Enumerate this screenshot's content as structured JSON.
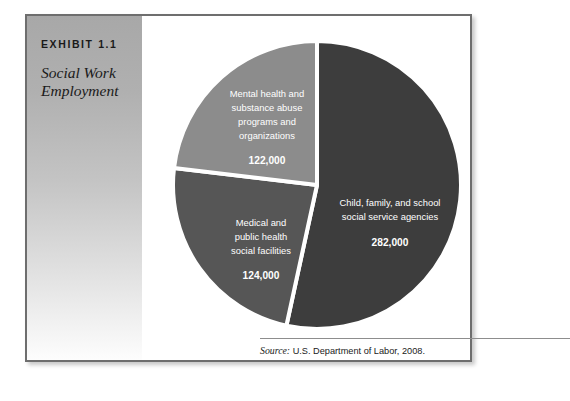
{
  "exhibit": {
    "number_label": "EXHIBIT 1.1",
    "title_line1": "Social Work",
    "title_line2": "Employment"
  },
  "source": {
    "label": "Source:",
    "text": "U.S. Department of Labor, 2008."
  },
  "colors": {
    "slice_dark": "#3d3d3d",
    "slice_medium": "#565656",
    "slice_light": "#8c8c8c",
    "separator": "#ffffff",
    "frame_border": "#6e6e6e",
    "panel_top": "#a8a8a8",
    "panel_bottom": "#fdfdfd"
  },
  "chart_data": {
    "type": "pie",
    "title": "Social Work Employment",
    "xlabel": "",
    "ylabel": "",
    "legend_position": "none",
    "grid": false,
    "total": 528000,
    "categories": [
      "Child, family, and school social service agencies",
      "Medical and public health social facilities",
      "Mental health and substance abuse programs and organizations"
    ],
    "values": [
      282000,
      124000,
      122000
    ],
    "value_labels": [
      "282,000",
      "124,000",
      "122,000"
    ],
    "slices": [
      {
        "name": "Child, family, and school social service agencies",
        "value": 282000,
        "value_label": "282,000",
        "percent": 53.4,
        "color": "#3d3d3d",
        "label_lines": [
          "Child, family, and school",
          "social service agencies"
        ]
      },
      {
        "name": "Medical and public health social facilities",
        "value": 124000,
        "value_label": "124,000",
        "percent": 23.5,
        "color": "#565656",
        "label_lines": [
          "Medical and",
          "public health",
          "social facilities"
        ]
      },
      {
        "name": "Mental health and substance abuse programs and organizations",
        "value": 122000,
        "value_label": "122,000",
        "percent": 23.1,
        "color": "#8c8c8c",
        "label_lines": [
          "Mental health and",
          "substance abuse",
          "programs and",
          "organizations"
        ]
      }
    ]
  }
}
